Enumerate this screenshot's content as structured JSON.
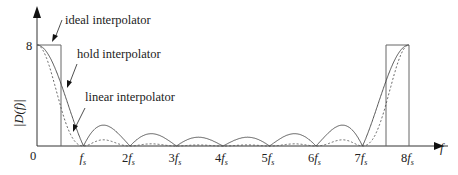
{
  "chart_data": {
    "type": "line",
    "title": "",
    "xlabel": "f",
    "ylabel": "|D(f)|",
    "x_ticks": [
      "0",
      "f_s",
      "2f_s",
      "3f_s",
      "4f_s",
      "5f_s",
      "6f_s",
      "7f_s",
      "8f_s"
    ],
    "y_ticks": [
      "8"
    ],
    "xlim": [
      0,
      8
    ],
    "ylim": [
      0,
      8
    ],
    "grid": false,
    "series": [
      {
        "name": "ideal interpolator",
        "style": "solid-rect",
        "description": "rectangle of height 8 for f in [0, 0.5fs] and [7.5fs, 8fs]"
      },
      {
        "name": "hold interpolator",
        "style": "solid",
        "description": "|8 sinc(f/fs)| style, zeros at every fs except multiples of 8fs; peak 8 at 0 and 8fs, side lobes ~1.7"
      },
      {
        "name": "linear interpolator",
        "style": "dashed",
        "description": "8 sinc^2 style, zeros at every fs except 0 and 8fs; peak 8 at 0 and 8fs, small side lobes ~0.4"
      }
    ],
    "annotations": [
      "ideal interpolator",
      "hold interpolator",
      "linear interpolator"
    ]
  },
  "labels": {
    "ideal": "ideal interpolator",
    "hold": "hold interpolator",
    "linear": "linear interpolator",
    "ylabel": "|D(f)|",
    "xlabel": "f",
    "y8": "8",
    "origin": "0",
    "ticks": [
      "",
      "1",
      "2",
      "3",
      "4",
      "5",
      "6",
      "7",
      "8"
    ]
  }
}
